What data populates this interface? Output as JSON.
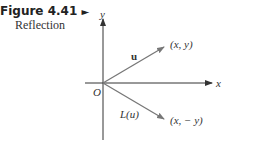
{
  "caption": {
    "figure_number": "Figure 4.41",
    "pointer": "►",
    "title": "Reflection"
  },
  "diagram": {
    "axes": {
      "x_label": "x",
      "y_label": "y",
      "origin_label": "O"
    },
    "vectors": [
      {
        "name": "u",
        "label": "u",
        "endpoint_label": "(x, y)"
      },
      {
        "name": "L(u)",
        "label": "L(u)",
        "endpoint_label": "(x, − y)"
      }
    ],
    "colors": {
      "axis": "#333333",
      "vector": "#777777"
    }
  }
}
